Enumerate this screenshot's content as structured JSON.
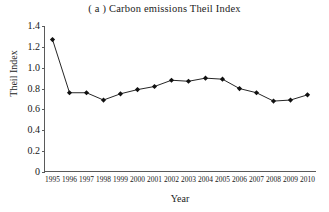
{
  "chart_data": {
    "type": "line",
    "title": "( a )  Carbon emissions Theil Index",
    "xlabel": "Year",
    "ylabel": "Theil Index",
    "categories": [
      "1995",
      "1996",
      "1997",
      "1998",
      "1999",
      "2000",
      "2001",
      "2002",
      "2003",
      "2004",
      "2005",
      "2006",
      "2007",
      "2008",
      "2009",
      "2010"
    ],
    "values": [
      1.27,
      0.76,
      0.76,
      0.69,
      0.75,
      0.79,
      0.82,
      0.88,
      0.87,
      0.9,
      0.89,
      0.8,
      0.76,
      0.68,
      0.69,
      0.74
    ],
    "series": [
      {
        "name": "Carbon emissions Theil Index",
        "values": [
          1.27,
          0.76,
          0.76,
          0.69,
          0.75,
          0.79,
          0.82,
          0.88,
          0.87,
          0.9,
          0.89,
          0.8,
          0.76,
          0.68,
          0.69,
          0.74
        ]
      }
    ],
    "x": [
      "1995",
      "1996",
      "1997",
      "1998",
      "1999",
      "2000",
      "2001",
      "2002",
      "2003",
      "2004",
      "2005",
      "2006",
      "2007",
      "2008",
      "2009",
      "2010"
    ],
    "ylim": [
      0,
      1.4
    ],
    "yticks": [
      "0",
      "0.2",
      "0.4",
      "0.6",
      "0.8",
      "1.0",
      "1.2",
      "1.4"
    ],
    "ytick_values": [
      0,
      0.2,
      0.4,
      0.6,
      0.8,
      1.0,
      1.2,
      1.4
    ],
    "grid": false,
    "legend": "none",
    "marker": "filled-diamond",
    "line_color": "#262626",
    "marker_color": "#111111",
    "axis_color": "#5a5a5a",
    "background": "#ffffff"
  }
}
